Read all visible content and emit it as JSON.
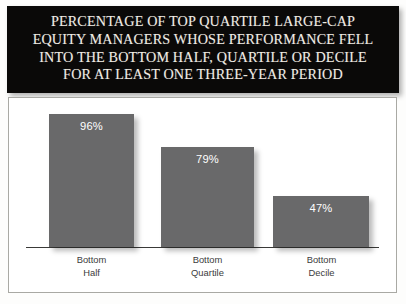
{
  "title": {
    "lines": [
      "PERCENTAGE OF TOP QUARTILE LARGE-CAP",
      "EQUITY MANAGERS WHOSE PERFORMANCE FELL",
      "INTO THE BOTTOM HALF, QUARTILE OR DECILE",
      "FOR AT LEAST ONE THREE-YEAR PERIOD"
    ]
  },
  "bars": [
    {
      "label_line1": "Bottom",
      "label_line2": "Half",
      "value_label": "96%",
      "left": 40,
      "width": 85,
      "height": 133,
      "cat_left": 33,
      "cat_width": 99
    },
    {
      "label_line1": "Bottom",
      "label_line2": "Quartile",
      "value_label": "79%",
      "left": 152,
      "width": 93,
      "height": 100,
      "cat_left": 149,
      "cat_width": 99
    },
    {
      "label_line1": "Bottom",
      "label_line2": "Decile",
      "value_label": "47%",
      "left": 264,
      "width": 96,
      "height": 51,
      "cat_left": 263,
      "cat_width": 99
    }
  ],
  "colors": {
    "bar_fill": "#69696a",
    "banner_background": "#0a0908",
    "banner_text": "#f0ece4",
    "axis": "#3a3a38",
    "category_text": "#3c3c3c",
    "value_text": "#ffffff",
    "frame_border": "#a9a9a4"
  },
  "chart_data": {
    "type": "bar",
    "title": "PERCENTAGE OF TOP QUARTILE LARGE-CAP EQUITY MANAGERS WHOSE PERFORMANCE FELL INTO THE BOTTOM HALF, QUARTILE OR DECILE FOR AT LEAST ONE THREE-YEAR PERIOD",
    "categories": [
      "Bottom Half",
      "Bottom Quartile",
      "Bottom Decile"
    ],
    "values": [
      96,
      79,
      47
    ],
    "data_labels": [
      "96%",
      "79%",
      "47%"
    ],
    "xlabel": "",
    "ylabel": "",
    "ylim": [
      0,
      100
    ],
    "unit": "percent",
    "grid": false,
    "legend": false,
    "axis_visible": {
      "x": true,
      "y": false
    }
  }
}
